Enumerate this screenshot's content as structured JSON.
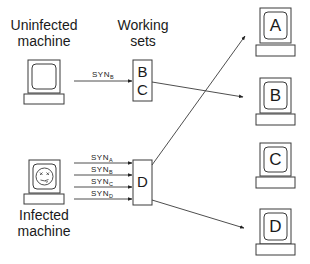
{
  "labels": {
    "uninfected_line1": "Uninfected",
    "uninfected_line2": "machine",
    "working_line1": "Working",
    "working_line2": "sets",
    "infected_line1": "Infected",
    "infected_line2": "machine"
  },
  "uninfected_syn": {
    "text": "SYN",
    "sub": "B"
  },
  "infected_syns": [
    {
      "text": "SYN",
      "sub": "A"
    },
    {
      "text": "SYN",
      "sub": "B"
    },
    {
      "text": "SYN",
      "sub": "C"
    },
    {
      "text": "SYN",
      "sub": "D"
    }
  ],
  "working_set_boxes": {
    "upper": {
      "line1": "B",
      "line2": "C"
    },
    "lower": {
      "line1": "D"
    }
  },
  "targets": [
    {
      "label": "A"
    },
    {
      "label": "B"
    },
    {
      "label": "C"
    },
    {
      "label": "D"
    }
  ],
  "colors": {
    "stroke": "#3a3a3a",
    "text": "#1a1a1a",
    "background": "#ffffff"
  }
}
